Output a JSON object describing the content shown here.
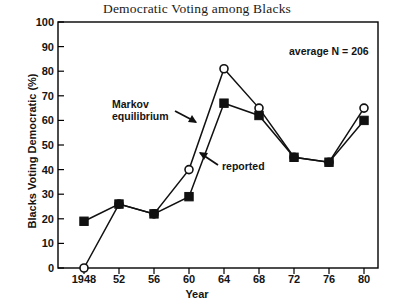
{
  "chart_data": {
    "type": "line",
    "title": "Democratic Voting among Blacks",
    "xlabel": "Year",
    "ylabel": "Blacks Voting Democratic (%)",
    "xlim": [
      1946,
      1982
    ],
    "ylim": [
      0,
      100
    ],
    "grid": false,
    "legend_position": "none",
    "x": [
      1948,
      1952,
      1956,
      1960,
      1964,
      1968,
      1972,
      1976,
      1980
    ],
    "xtick_labels": [
      "1948",
      "52",
      "56",
      "60",
      "64",
      "68",
      "72",
      "76",
      "80"
    ],
    "ytick_labels": [
      "0",
      "10",
      "20",
      "30",
      "40",
      "50",
      "60",
      "70",
      "80",
      "90",
      "100"
    ],
    "ytick_values": [
      0,
      10,
      20,
      30,
      40,
      50,
      60,
      70,
      80,
      90,
      100
    ],
    "series": [
      {
        "name": "Markov equilibrium",
        "marker": "open-circle",
        "values": [
          0,
          26,
          22,
          40,
          81,
          65,
          45,
          43,
          65
        ]
      },
      {
        "name": "reported",
        "marker": "filled-square",
        "values": [
          19,
          26,
          22,
          29,
          67,
          62,
          45,
          43,
          60
        ]
      }
    ],
    "annotations": [
      {
        "id": "average-n",
        "text": "average N = 206"
      },
      {
        "id": "markov",
        "line1": "Markov",
        "line2": "equilibrium"
      },
      {
        "id": "reported",
        "text": "reported"
      }
    ]
  },
  "colors": {
    "axis": "#000000",
    "marker_fill": "#111111",
    "background": "#ffffff",
    "line": "#111111"
  }
}
